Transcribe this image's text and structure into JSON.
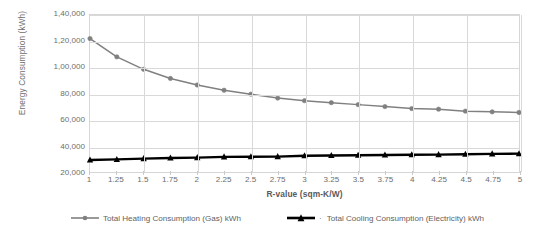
{
  "chart_data": {
    "type": "line",
    "title": "",
    "xlabel": "R-value (sqm-K/W)",
    "ylabel": "Energy Consumption (kWh)",
    "x": [
      1,
      1.25,
      1.5,
      1.75,
      2,
      2.25,
      2.5,
      2.75,
      3,
      3.25,
      3.5,
      3.75,
      4,
      4.25,
      4.5,
      4.75,
      5
    ],
    "xtick_labels": [
      "1",
      "1.25",
      "1.5",
      "1.75",
      "2",
      "2.25",
      "2.5",
      "2.75",
      "3",
      "3.25",
      "3.5",
      "3.75",
      "4",
      "4.25",
      "4.5",
      "4.75",
      "5"
    ],
    "ytick_labels": [
      "1,40,000",
      "1,20,000",
      "1,00,000",
      "80,000",
      "60,000",
      "40,000",
      "20,000"
    ],
    "ytick_values": [
      140000,
      120000,
      100000,
      80000,
      60000,
      40000,
      20000
    ],
    "ylim": [
      20000,
      140000
    ],
    "xlim": [
      1,
      5
    ],
    "grid": true,
    "legend_position": "bottom",
    "series": [
      {
        "name": "Total Heating Consumption (Gas) kWh",
        "color": "#808080",
        "marker": "circle",
        "values": [
          122000,
          108000,
          98500,
          91500,
          86500,
          82500,
          79500,
          76500,
          74500,
          73000,
          71500,
          70000,
          68500,
          68000,
          66500,
          66000,
          65500
        ]
      },
      {
        "name": "Total Cooling Consumption (Electricity) kWh",
        "color": "#000000",
        "marker": "triangle",
        "values": [
          29200,
          29600,
          30200,
          30700,
          31000,
          31600,
          31700,
          31800,
          32400,
          32600,
          32800,
          33000,
          33200,
          33300,
          33600,
          33900,
          34000
        ]
      }
    ]
  },
  "legend": {
    "entries": [
      {
        "label": "Total Heating Consumption (Gas) kWh"
      },
      {
        "label": "Total Cooling Consumption (Electricity) kWh",
        "separator": "·"
      }
    ]
  },
  "colors": {
    "heating": "#808080",
    "cooling": "#000000",
    "gridline": "#d9d9d9",
    "axis_text": "#6e6e6e",
    "plot_border": "#d6d6d6"
  }
}
